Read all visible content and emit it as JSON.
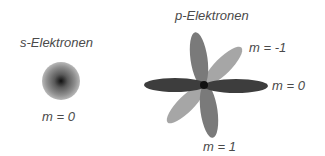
{
  "s_orbital": {
    "title": "s-Elektronen",
    "states": [
      {
        "label": "m = 0"
      }
    ]
  },
  "p_orbital": {
    "title": "p-Elektronen",
    "states": [
      {
        "label": "m = -1",
        "color": "#a6a6a6"
      },
      {
        "label": "m = 0",
        "color": "#3d3d3d"
      },
      {
        "label": "m = 1",
        "color": "#7a7a7a"
      }
    ]
  },
  "colors": {
    "text": "#4a4a4a",
    "nucleus": "#111111"
  }
}
